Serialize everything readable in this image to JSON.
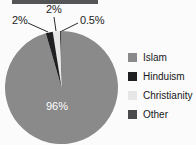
{
  "background_color": "#fbfbfb",
  "top_bar": {
    "name": "clipped-title-bar",
    "color": "#555456"
  },
  "chart_data": {
    "type": "pie",
    "title": "",
    "subtitle": "",
    "xlabel": "",
    "ylabel": "",
    "legend_position": "right",
    "grid": false,
    "categories": [
      "Islam",
      "Hinduism",
      "Christianity",
      "Other"
    ],
    "values": [
      96,
      2,
      2,
      0.5
    ],
    "value_labels": [
      "96%",
      "2%",
      "2%",
      "0.5%"
    ],
    "colors": [
      "#8a8a8a",
      "#1f1f22",
      "#e6e6e6",
      "#4a4a4d"
    ],
    "slice_label_colors": [
      "#ffffff",
      "#1c1c1c",
      "#1c1c1c",
      "#1c1c1c"
    ],
    "annotations": [
      {
        "text": "2%",
        "points_to": "Hinduism"
      },
      {
        "text": "2%",
        "points_to": "Christianity"
      },
      {
        "text": "0.5%",
        "points_to": "Other"
      },
      {
        "text": "96%",
        "points_to": "Islam"
      }
    ]
  },
  "labels": {
    "left": "2%",
    "middle": "2%",
    "right": "0.5%",
    "inside": "96%"
  },
  "legend": {
    "items": [
      {
        "label": "Islam",
        "color": "#8a8a8a"
      },
      {
        "label": "Hinduism",
        "color": "#1f1f22"
      },
      {
        "label": "Christianity",
        "color": "#e6e6e6"
      },
      {
        "label": "Other",
        "color": "#4a4a4d"
      }
    ]
  }
}
